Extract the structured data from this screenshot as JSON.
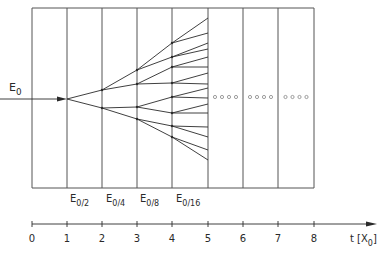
{
  "diagram": {
    "type": "electromagnetic-shower-branching",
    "colors": {
      "line": "#2a2a2a",
      "grid": "#555555",
      "background": "#ffffff"
    },
    "grid": {
      "left": 32,
      "top": 8,
      "bottom": 188,
      "column_x": [
        32,
        67,
        102,
        137,
        172,
        208,
        243,
        278,
        314
      ]
    },
    "incoming": {
      "label": "E",
      "label_sub": "0",
      "y": 99,
      "x_start": 0,
      "x_end": 67
    },
    "generations": [
      {
        "x": 67,
        "y": [
          99
        ]
      },
      {
        "x": 102,
        "y": [
          90,
          108
        ]
      },
      {
        "x": 137,
        "y": [
          70,
          84,
          107,
          119
        ]
      },
      {
        "x": 172,
        "y": [
          43,
          57,
          67,
          83,
          97,
          113,
          126,
          137
        ]
      },
      {
        "x": 208,
        "y": [
          18,
          33,
          43,
          49,
          57,
          67,
          73,
          84,
          88,
          98,
          104,
          113,
          127,
          137,
          150,
          160
        ]
      }
    ],
    "continuation": {
      "symbol": "o o o o",
      "y": 97,
      "columns": [
        5,
        6,
        7
      ]
    },
    "energy_labels": [
      {
        "text": "E",
        "sub": "0/2",
        "x": 70
      },
      {
        "text": "E",
        "sub": "0/4",
        "x": 106
      },
      {
        "text": "E",
        "sub": "0/8",
        "x": 140
      },
      {
        "text": "E",
        "sub": "0/16",
        "x": 176
      }
    ],
    "axis": {
      "y": 224,
      "x_start": 32,
      "x_end": 377,
      "ticks": [
        "0",
        "1",
        "2",
        "3",
        "4",
        "5",
        "6",
        "7",
        "8"
      ],
      "label": "t [X",
      "label_sub": "0",
      "label_close": "]"
    }
  }
}
